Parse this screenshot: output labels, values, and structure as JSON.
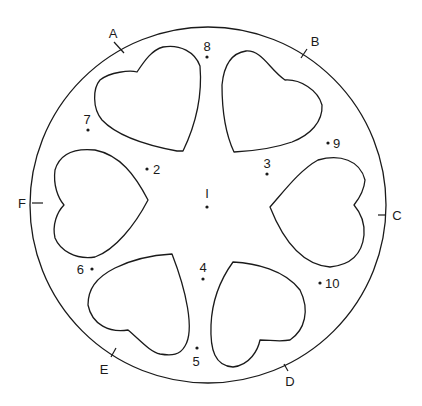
{
  "diagram": {
    "circle": {
      "cx": 208,
      "cy": 205,
      "r": 178,
      "stroke": "#1a1a1a"
    },
    "perimeter_points": [
      {
        "id": "A",
        "label": "A",
        "tick": [
          114,
          42,
          124,
          53
        ],
        "label_pos": [
          113,
          38
        ]
      },
      {
        "id": "B",
        "label": "B",
        "tick": [
          307,
          49,
          301,
          58
        ],
        "label_pos": [
          315,
          46
        ]
      },
      {
        "id": "C",
        "label": "C",
        "tick": [
          378,
          215,
          386,
          215
        ],
        "label_pos": [
          397,
          220
        ]
      },
      {
        "id": "D",
        "label": "D",
        "tick": [
          284,
          364,
          288,
          371
        ],
        "label_pos": [
          290,
          386
        ]
      },
      {
        "id": "E",
        "label": "E",
        "tick": [
          116,
          348,
          111,
          357
        ],
        "label_pos": [
          104,
          374
        ]
      },
      {
        "id": "F",
        "label": "F",
        "tick": [
          32,
          203,
          43,
          203
        ],
        "label_pos": [
          22,
          208
        ]
      }
    ],
    "numbered_points": [
      {
        "id": "1",
        "label": "I",
        "dot": [
          207,
          207
        ],
        "label_pos": [
          207,
          198
        ],
        "anchor": "middle"
      },
      {
        "id": "2",
        "label": "2",
        "dot": [
          147,
          169
        ],
        "label_pos": [
          153,
          174
        ],
        "anchor": "start"
      },
      {
        "id": "3",
        "label": "3",
        "dot": [
          267,
          174
        ],
        "label_pos": [
          267,
          168
        ],
        "anchor": "middle"
      },
      {
        "id": "4",
        "label": "4",
        "dot": [
          203,
          279
        ],
        "label_pos": [
          203,
          272
        ],
        "anchor": "middle"
      },
      {
        "id": "5",
        "label": "5",
        "dot": [
          197,
          348
        ],
        "label_pos": [
          196,
          366
        ],
        "anchor": "middle"
      },
      {
        "id": "6",
        "label": "6",
        "dot": [
          92,
          269
        ],
        "label_pos": [
          84,
          274
        ],
        "anchor": "end"
      },
      {
        "id": "7",
        "label": "7",
        "dot": [
          88,
          130
        ],
        "label_pos": [
          87,
          124
        ],
        "anchor": "middle"
      },
      {
        "id": "8",
        "label": "8",
        "dot": [
          207,
          57
        ],
        "label_pos": [
          207,
          51
        ],
        "anchor": "middle"
      },
      {
        "id": "9",
        "label": "9",
        "dot": [
          328,
          143
        ],
        "label_pos": [
          333,
          148
        ],
        "anchor": "start"
      },
      {
        "id": "10",
        "label": "10",
        "dot": [
          320,
          283
        ],
        "label_pos": [
          325,
          288
        ],
        "anchor": "start"
      }
    ],
    "hearts": [
      {
        "id": "heart-top-left",
        "path": "M183,151 L177,151 C150,146 118,137 102,120 C92,108 93,88 100,80 C110,72 130,70 137,72 C145,60 152,50 163,47 C180,44 195,52 200,66 C202,90 198,120 183,151 Z"
      },
      {
        "id": "heart-top-right",
        "path": "M234,152 C226,135 222,110 222,85 C224,64 232,53 246,51 C262,50 270,70 285,80 C300,79 318,90 322,105 C323,122 310,135 292,142 C275,148 255,151 234,152 Z"
      },
      {
        "id": "heart-right",
        "path": "M270,207 C285,190 300,170 318,160 C340,154 360,160 365,180 C364,192 358,200 354,205 C360,212 365,222 364,235 C362,255 350,265 330,267 C305,265 285,245 270,207 Z"
      },
      {
        "id": "heart-bottom-right",
        "path": "M233,262 C255,263 285,270 300,290 C310,310 305,330 290,340 C280,342 270,340 260,340 C258,350 250,365 233,367 C215,366 210,350 211,325 C212,300 220,280 233,262 Z"
      },
      {
        "id": "heart-bottom-left",
        "path": "M172,254 C186,290 195,330 185,346 C180,355 172,356 160,354 C150,352 140,340 128,330 C110,333 92,325 88,305 C88,290 95,278 115,268 C135,258 155,255 172,254 Z"
      },
      {
        "id": "heart-left",
        "path": "M148,200 C135,225 115,250 95,257 C75,260 60,250 55,238 C52,225 57,212 64,205 C58,198 53,185 55,170 C60,153 75,148 95,150 C120,155 135,175 148,200 Z"
      }
    ]
  }
}
